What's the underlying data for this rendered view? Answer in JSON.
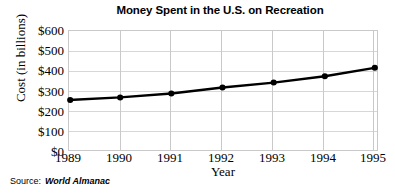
{
  "chart_data": {
    "type": "line",
    "title": "Money Spent in the U.S. on Recreation",
    "xlabel": "Year",
    "ylabel": "Cost (in billions)",
    "categories": [
      "1989",
      "1990",
      "1991",
      "1992",
      "1993",
      "1994",
      "1995"
    ],
    "x": [
      1989,
      1990,
      1991,
      1992,
      1993,
      1994,
      1995
    ],
    "values": [
      252,
      265,
      285,
      315,
      340,
      372,
      415
    ],
    "series": [
      {
        "name": "Money Spent on Recreation",
        "values": [
          252,
          265,
          285,
          315,
          340,
          372,
          415
        ]
      }
    ],
    "ylim": [
      0,
      600
    ],
    "yticks": [
      0,
      100,
      200,
      300,
      400,
      500,
      600
    ],
    "ytick_labels": [
      "$0",
      "$100",
      "$200",
      "$300",
      "$400",
      "$500",
      "$600"
    ],
    "xtick_labels": [
      "1989",
      "1990",
      "1991",
      "1992",
      "1993",
      "1994",
      "1995"
    ],
    "grid": true,
    "legend": false,
    "legend_position": "none",
    "line_color": "#000000",
    "marker": "circle",
    "marker_color": "#000000",
    "grid_color": "#d7d7d7",
    "axis_color": "#c9c9c9",
    "background_color": "#ffffff"
  },
  "source": {
    "label": "Source:",
    "name": "World Almanac"
  }
}
